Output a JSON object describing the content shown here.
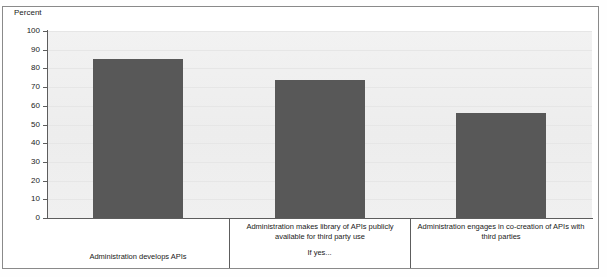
{
  "chart_data": {
    "type": "bar",
    "title": "",
    "subtitle": "",
    "xlabel": "",
    "ylabel": "Percent",
    "ylim": [
      0,
      100
    ],
    "grid": true,
    "legend": false,
    "legend_position": "none",
    "bar_color": "#585858",
    "plot_background": "#efefef",
    "categories": [
      "Administration develops APIs",
      "Administration makes library of APIs publicly available for third party use",
      "Administration engages in co-creation of APIs with third parties"
    ],
    "values": [
      85,
      74,
      56
    ],
    "ytick_labels": [
      "100",
      "90",
      "80",
      "70",
      "60",
      "50",
      "40",
      "30",
      "20",
      "10",
      "0"
    ],
    "ytick_values": [
      100,
      90,
      80,
      70,
      60,
      50,
      40,
      30,
      20,
      10,
      0
    ],
    "annotations": [
      {
        "text": "If yes...",
        "attached_to_category_index": 1
      }
    ]
  },
  "axis": {
    "y_title": "Percent"
  }
}
